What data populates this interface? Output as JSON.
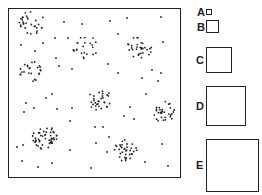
{
  "diagram": {
    "field": {
      "x": 8,
      "y": 8,
      "width": 172,
      "height": 169
    },
    "quadrats": [
      {
        "label": "A",
        "x": 206,
        "y": 9,
        "size": 6,
        "label_x": 197,
        "label_y": 7
      },
      {
        "label": "B",
        "x": 206,
        "y": 20,
        "size": 13,
        "label_x": 197,
        "label_y": 22
      },
      {
        "label": "C",
        "x": 206,
        "y": 47,
        "size": 26,
        "label_x": 196,
        "label_y": 55
      },
      {
        "label": "D",
        "x": 206,
        "y": 86,
        "size": 40,
        "label_x": 196,
        "label_y": 101
      },
      {
        "label": "E",
        "x": 206,
        "y": 139,
        "size": 53,
        "label_x": 196,
        "label_y": 160
      }
    ],
    "clusters": [
      {
        "cx": 30,
        "cy": 22,
        "r": 14,
        "n": 30
      },
      {
        "cx": 85,
        "cy": 47,
        "r": 13,
        "n": 22
      },
      {
        "cx": 140,
        "cy": 47,
        "r": 13,
        "n": 30
      },
      {
        "cx": 32,
        "cy": 72,
        "r": 12,
        "n": 24
      },
      {
        "cx": 100,
        "cy": 100,
        "r": 12,
        "n": 30
      },
      {
        "cx": 165,
        "cy": 112,
        "r": 12,
        "n": 30
      },
      {
        "cx": 45,
        "cy": 138,
        "r": 13,
        "n": 50
      },
      {
        "cx": 125,
        "cy": 150,
        "r": 12,
        "n": 35
      }
    ],
    "scattered": [
      [
        64,
        22
      ],
      [
        82,
        24
      ],
      [
        110,
        21
      ],
      [
        127,
        18
      ],
      [
        161,
        17
      ],
      [
        118,
        34
      ],
      [
        68,
        38
      ],
      [
        55,
        38
      ],
      [
        21,
        45
      ],
      [
        35,
        51
      ],
      [
        43,
        43
      ],
      [
        163,
        42
      ],
      [
        56,
        58
      ],
      [
        59,
        66
      ],
      [
        72,
        69
      ],
      [
        108,
        64
      ],
      [
        118,
        73
      ],
      [
        152,
        70
      ],
      [
        161,
        73
      ],
      [
        142,
        78
      ],
      [
        158,
        81
      ],
      [
        52,
        94
      ],
      [
        46,
        98
      ],
      [
        26,
        103
      ],
      [
        34,
        108
      ],
      [
        24,
        112
      ],
      [
        57,
        109
      ],
      [
        72,
        108
      ],
      [
        130,
        107
      ],
      [
        146,
        94
      ],
      [
        124,
        116
      ],
      [
        134,
        119
      ],
      [
        70,
        121
      ],
      [
        95,
        127
      ],
      [
        103,
        127
      ],
      [
        109,
        137
      ],
      [
        96,
        143
      ],
      [
        107,
        152
      ],
      [
        70,
        150
      ],
      [
        162,
        144
      ],
      [
        17,
        147
      ],
      [
        23,
        145
      ],
      [
        22,
        161
      ],
      [
        38,
        167
      ],
      [
        52,
        163
      ],
      [
        91,
        168
      ],
      [
        145,
        162
      ],
      [
        168,
        166
      ]
    ],
    "colors": {
      "ink": "#222222",
      "background": "#ffffff"
    }
  }
}
